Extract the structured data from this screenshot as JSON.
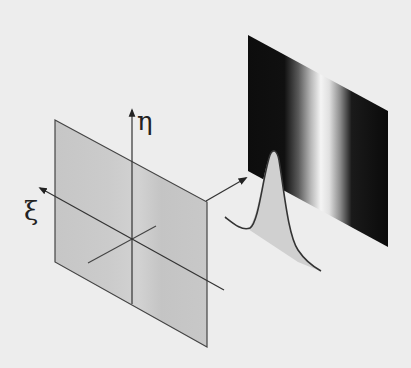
{
  "diagram": {
    "kind": "optics-illustration",
    "colors": {
      "background": "#ededed",
      "plane_fill": "#c9c9c9",
      "line": "#333333",
      "pattern_dark": "#0c0c0c",
      "pattern_light": "#f2f2f2",
      "profile_fill": "#cfcfcf"
    },
    "labels": {
      "eta_axis": "η",
      "xi_axis": "ξ"
    },
    "elements": {
      "input_plane": "input plane (ξ, η)",
      "propagation_arrow": "propagation arrow",
      "output_pattern": "intensity fringe pattern",
      "intensity_profile": "Gaussian intensity profile"
    }
  }
}
